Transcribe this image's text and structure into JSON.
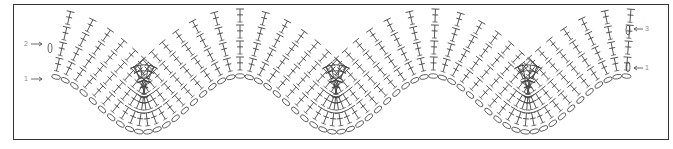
{
  "diagram": {
    "type": "crochet-chart",
    "pattern": "chevron ripple",
    "frame_color": "#333333",
    "stitch_color": "#444444",
    "label_color": "#888888",
    "row_labels_left": [
      {
        "label": "2",
        "y": 44
      },
      {
        "label": "1",
        "y": 79
      }
    ],
    "row_labels_right": [
      {
        "label": "3",
        "y": 29
      },
      {
        "label": "1",
        "y": 68
      }
    ],
    "peaks_x": [
      240,
      432,
      625
    ],
    "valleys_x": [
      54,
      145,
      337,
      528
    ],
    "symbols": {
      "dc": "double crochet (T with crossbar)",
      "ch": "chain (oval)",
      "arrow": "row direction"
    }
  }
}
